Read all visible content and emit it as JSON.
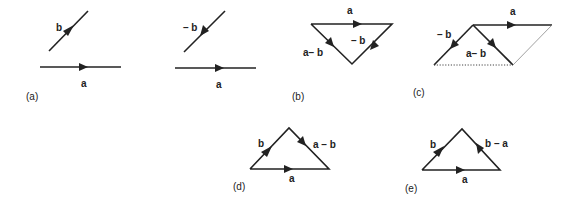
{
  "diagram": {
    "panels": [
      {
        "id": "a",
        "caption": "(a)",
        "vectors": [
          {
            "label": "b",
            "direction": "up-right"
          },
          {
            "label": "a",
            "direction": "right"
          }
        ]
      },
      {
        "id": "b1",
        "caption": "",
        "vectors": [
          {
            "label": "– b",
            "direction": "down-left"
          },
          {
            "label": "a",
            "direction": "right"
          }
        ]
      },
      {
        "id": "b",
        "caption": "(b)",
        "vectors": [
          {
            "label": "a",
            "direction": "right"
          },
          {
            "label": "– b",
            "direction": "down-left"
          },
          {
            "label": "a– b",
            "direction": "down-right"
          }
        ]
      },
      {
        "id": "c",
        "caption": "(c)",
        "vectors": [
          {
            "label": "a",
            "direction": "right"
          },
          {
            "label": "– b",
            "direction": "down-left"
          },
          {
            "label": "a– b",
            "direction": "down-right"
          }
        ],
        "extras": [
          "dotted base line",
          "thin parallelogram side"
        ]
      },
      {
        "id": "d",
        "caption": "(d)",
        "vectors": [
          {
            "label": "b",
            "direction": "up-right"
          },
          {
            "label": "a – b",
            "direction": "down-right"
          },
          {
            "label": "a",
            "direction": "right"
          }
        ]
      },
      {
        "id": "e",
        "caption": "(e)",
        "vectors": [
          {
            "label": "b",
            "direction": "up-right"
          },
          {
            "label": "b – a",
            "direction": "up-left"
          },
          {
            "label": "a",
            "direction": "right"
          }
        ]
      }
    ]
  },
  "labels": {
    "a_b": "b",
    "a_a": "a",
    "a_cap": "(a)",
    "b1_negb": "– b",
    "b1_a": "a",
    "b_a": "a",
    "b_negb": "– b",
    "b_amb": "a– b",
    "b_cap": "(b)",
    "c_a": "a",
    "c_negb": "– b",
    "c_amb": "a– b",
    "c_cap": "(c)",
    "d_b": "b",
    "d_amb": "a – b",
    "d_a": "a",
    "d_cap": "(d)",
    "e_b": "b",
    "e_bma": "b – a",
    "e_a": "a",
    "e_cap": "(e)"
  }
}
